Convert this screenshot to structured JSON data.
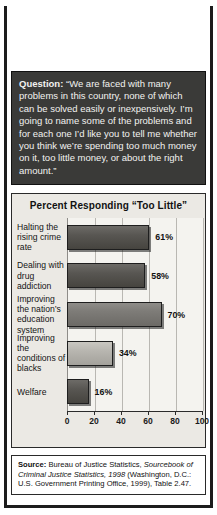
{
  "banner": {
    "word1": "What",
    "word2": "Americans",
    "word3": "Think"
  },
  "question": {
    "label": "Question:",
    "text": " “We are faced with many problems in this country, none of which can be solved easily or inexpensively. I’m going to name some of the problems and for each one I’d like you to tell me whether you think we’re spending too much money on it, too little money, or about the right amount.”"
  },
  "chart_data": {
    "type": "bar",
    "orientation": "horizontal",
    "title": "Percent Responding “Too Little”",
    "categories": [
      "Halting the rising crime rate",
      "Dealing with drug addiction",
      "Improving the nation’s education system",
      "Improving the conditions of blacks",
      "Welfare"
    ],
    "values": [
      61,
      58,
      70,
      34,
      16
    ],
    "value_labels": [
      "61%",
      "58%",
      "70%",
      "34%",
      "16%"
    ],
    "xlabel": "",
    "ylabel": "",
    "xlim": [
      0,
      100
    ],
    "xticks": [
      0,
      20,
      40,
      60,
      80,
      100
    ],
    "xtick_labels": [
      "0",
      "20",
      "40",
      "60",
      "80",
      "100"
    ],
    "grid": true,
    "legend": false
  },
  "source": {
    "label": "Source:",
    "part1": " Bureau of Justice Statistics, ",
    "italic1": "Sourcebook of Criminal Justice Statistics, 1998",
    "part2": " (Washington, D.C.: U.S. Government Printing Office, 1999), Table 2.47."
  }
}
